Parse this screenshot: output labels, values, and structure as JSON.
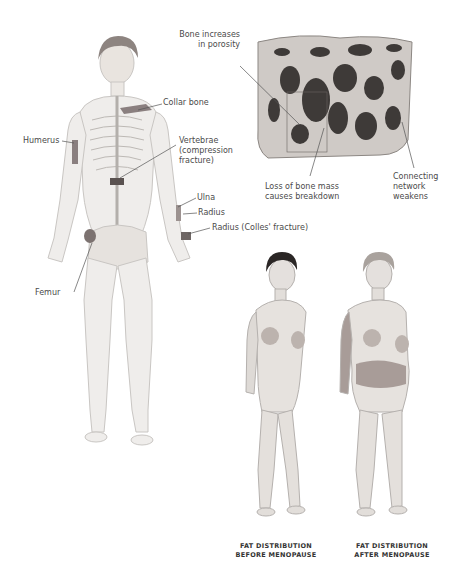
{
  "skeleton_figure": {
    "labels": {
      "collar_bone": "Collar bone",
      "humerus": "Humerus",
      "vertebrae_line1": "Vertebrae",
      "vertebrae_line2": "(compression",
      "vertebrae_line3": "fracture)",
      "ulna": "Ulna",
      "radius": "Radius",
      "radius_colles": "Radius (Colles' fracture)",
      "femur": "Femur"
    },
    "highlight_color": "#8a7f7f"
  },
  "bone_block": {
    "labels": {
      "porosity_line1": "Bone increases",
      "porosity_line2": "in porosity",
      "loss_line1": "Loss of bone mass",
      "loss_line2": "causes breakdown",
      "network_line1": "Connecting",
      "network_line2": "network",
      "network_line3": "weakens"
    }
  },
  "comparison": {
    "before": {
      "line1": "FAT DISTRIBUTION",
      "line2": "BEFORE MENOPAUSE"
    },
    "after": {
      "line1": "FAT DISTRIBUTION",
      "line2": "AFTER MENOPAUSE"
    },
    "fat_color": "#a89c98"
  },
  "colors": {
    "line": "#555555",
    "text": "#4a4a4a",
    "bone_light": "#e6e3e0",
    "bone_dark": "#3e3a38"
  }
}
